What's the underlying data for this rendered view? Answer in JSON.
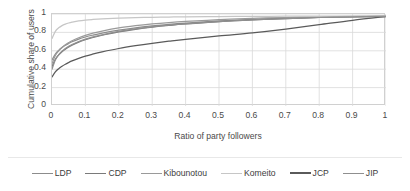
{
  "chart_data": {
    "type": "line",
    "title": "",
    "xlabel": "Ratio of party followers",
    "ylabel": "Cumulative share of users",
    "xlim": [
      0,
      1
    ],
    "ylim": [
      0,
      1
    ],
    "xticks": [
      "0",
      "0.1",
      "0.2",
      "0.3",
      "0.4",
      "0.5",
      "0.6",
      "0.7",
      "0.8",
      "0.9",
      "1"
    ],
    "xtick_values": [
      0,
      0.1,
      0.2,
      0.3,
      0.4,
      0.5,
      0.6,
      0.7,
      0.8,
      0.9,
      1
    ],
    "yticks": [
      "0",
      "0.2",
      "0.4",
      "0.6",
      "0.8",
      "1"
    ],
    "ytick_values": [
      0,
      0.2,
      0.4,
      0.6,
      0.8,
      1
    ],
    "grid": true,
    "grid_color": "#d9d9d9",
    "legend_position": "bottom",
    "x": [
      0,
      0.01,
      0.02,
      0.03,
      0.04,
      0.05,
      0.06,
      0.08,
      0.1,
      0.12,
      0.15,
      0.2,
      0.25,
      0.3,
      0.35,
      0.4,
      0.5,
      0.6,
      0.7,
      0.8,
      0.9,
      1
    ],
    "series": [
      {
        "name": "LDP",
        "color": "#8c8c8c",
        "values": [
          0.5,
          0.565,
          0.605,
          0.635,
          0.66,
          0.68,
          0.698,
          0.727,
          0.75,
          0.769,
          0.793,
          0.825,
          0.85,
          0.87,
          0.887,
          0.901,
          0.924,
          0.941,
          0.954,
          0.964,
          0.971,
          0.975
        ]
      },
      {
        "name": "CDP",
        "color": "#7a7a7a",
        "values": [
          0.43,
          0.508,
          0.555,
          0.59,
          0.618,
          0.641,
          0.661,
          0.694,
          0.72,
          0.742,
          0.769,
          0.806,
          0.834,
          0.857,
          0.876,
          0.892,
          0.918,
          0.937,
          0.951,
          0.962,
          0.97,
          0.975
        ]
      },
      {
        "name": "Kibounotou",
        "color": "#9a9a9a",
        "values": [
          0.46,
          0.548,
          0.599,
          0.636,
          0.665,
          0.689,
          0.709,
          0.742,
          0.768,
          0.789,
          0.815,
          0.849,
          0.873,
          0.892,
          0.907,
          0.919,
          0.938,
          0.952,
          0.962,
          0.969,
          0.974,
          0.977
        ]
      },
      {
        "name": "Komeito",
        "color": "#c6c6c6",
        "values": [
          0.735,
          0.812,
          0.85,
          0.874,
          0.89,
          0.902,
          0.911,
          0.925,
          0.934,
          0.94,
          0.947,
          0.955,
          0.96,
          0.964,
          0.967,
          0.969,
          0.972,
          0.974,
          0.976,
          0.977,
          0.978,
          0.979
        ]
      },
      {
        "name": "JCP",
        "color": "#5a5a5a",
        "values": [
          0.315,
          0.37,
          0.405,
          0.432,
          0.454,
          0.473,
          0.49,
          0.518,
          0.542,
          0.562,
          0.588,
          0.625,
          0.655,
          0.681,
          0.704,
          0.725,
          0.762,
          0.795,
          0.836,
          0.884,
          0.932,
          0.972
        ]
      },
      {
        "name": "JIP",
        "color": "#8f8f8f",
        "values": [
          0.4,
          0.5,
          0.556,
          0.595,
          0.625,
          0.649,
          0.669,
          0.701,
          0.727,
          0.748,
          0.774,
          0.81,
          0.838,
          0.86,
          0.878,
          0.893,
          0.918,
          0.937,
          0.951,
          0.962,
          0.97,
          0.975
        ]
      }
    ]
  },
  "legend": {
    "items": [
      {
        "label": "LDP",
        "color": "#8c8c8c"
      },
      {
        "label": "CDP",
        "color": "#7a7a7a"
      },
      {
        "label": "Kibounotou",
        "color": "#9a9a9a"
      },
      {
        "label": "Komeito",
        "color": "#c6c6c6"
      },
      {
        "label": "JCP",
        "color": "#5a5a5a"
      },
      {
        "label": "JIP",
        "color": "#8f8f8f"
      }
    ]
  }
}
